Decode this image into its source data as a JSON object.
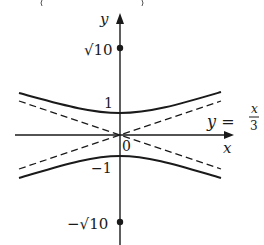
{
  "figure": {
    "type": "hyperbola-graph",
    "equation_asymptote": "y = x/3",
    "axes": {
      "x_label": "x",
      "y_label": "y",
      "origin_label": "0"
    },
    "y_ticks": [
      {
        "label": "√10",
        "value": 3.162,
        "marked": true
      },
      {
        "label": "1",
        "value": 1
      },
      {
        "label": "−1",
        "value": -1
      },
      {
        "label": "−√10",
        "value": -3.162,
        "marked": true
      }
    ],
    "asymptote_label": {
      "lhs": "y =",
      "num": "x",
      "den": "3"
    },
    "curves": [
      {
        "name": "upper-branch",
        "style": "solid"
      },
      {
        "name": "lower-branch",
        "style": "solid"
      },
      {
        "name": "asymptote-positive",
        "style": "dashed"
      },
      {
        "name": "asymptote-negative",
        "style": "dashed"
      }
    ],
    "colors": {
      "ink": "#1a1a1a",
      "background": "#ffffff"
    }
  }
}
